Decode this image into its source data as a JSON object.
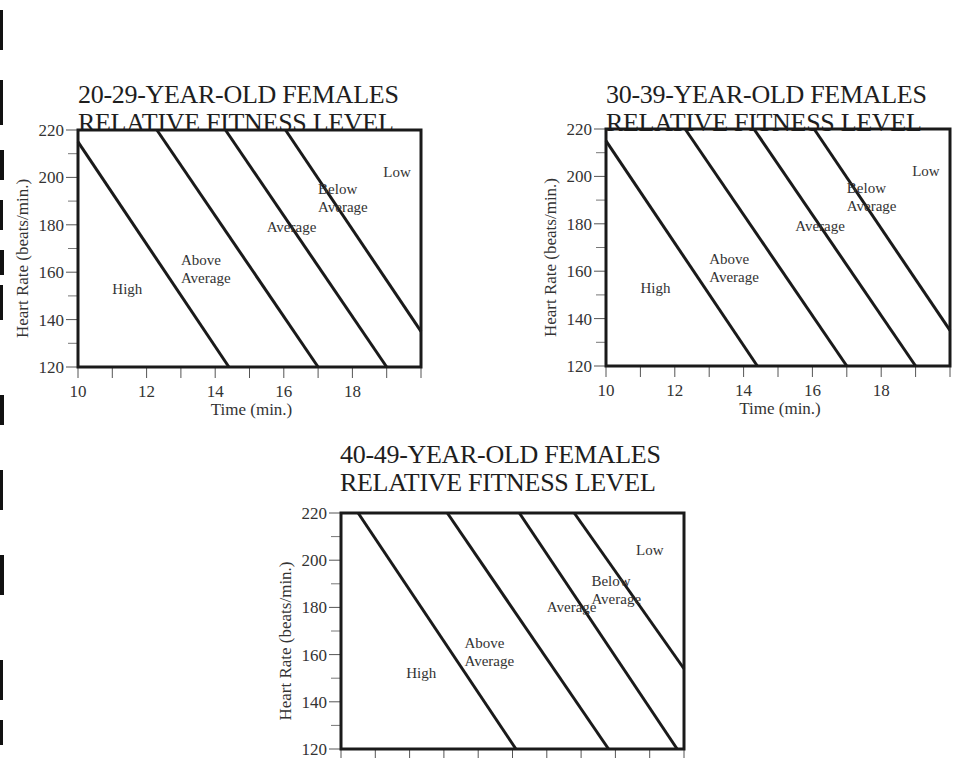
{
  "page": {
    "background": "#ffffff",
    "line_color": "#1a1a1a"
  },
  "chart_data": [
    {
      "type": "line",
      "title": "20-29-YEAR-OLD FEMALES",
      "subtitle": "RELATIVE FITNESS LEVEL",
      "xlabel": "Time (min.)",
      "ylabel": "Heart Rate (beats/min.)",
      "xlim": [
        10,
        20
      ],
      "ylim": [
        120,
        220
      ],
      "x_ticks": [
        10,
        12,
        14,
        16,
        18
      ],
      "x_minor_ticks": [
        10,
        11,
        12,
        13,
        14,
        15,
        16,
        17,
        18,
        19,
        20
      ],
      "y_ticks": [
        120,
        140,
        160,
        180,
        200,
        220
      ],
      "y_minor_ticks": [
        130,
        150,
        170,
        190,
        210
      ],
      "grid": false,
      "series": [
        {
          "name": "High / Above Average boundary",
          "x": [
            10.0,
            14.4
          ],
          "y": [
            215,
            120
          ]
        },
        {
          "name": "Above Average / Average boundary",
          "x": [
            12.3,
            17.0
          ],
          "y": [
            220,
            120
          ]
        },
        {
          "name": "Average / Below Average boundary",
          "x": [
            14.3,
            19.0
          ],
          "y": [
            220,
            120
          ]
        },
        {
          "name": "Below Average / Low boundary",
          "x": [
            16.05,
            20.0
          ],
          "y": [
            220,
            135
          ]
        }
      ],
      "region_labels": [
        {
          "text": "High",
          "lines": [
            "High"
          ],
          "x": 11.0,
          "y": 151
        },
        {
          "text": "Above Average",
          "lines": [
            "Above",
            "Average"
          ],
          "x": 13.0,
          "y": 163
        },
        {
          "text": "Average",
          "lines": [
            "Average"
          ],
          "x": 15.5,
          "y": 177
        },
        {
          "text": "Below Average",
          "lines": [
            "Below",
            "Average"
          ],
          "x": 17.0,
          "y": 193
        },
        {
          "text": "Low",
          "lines": [
            "Low"
          ],
          "x": 18.9,
          "y": 200
        }
      ]
    },
    {
      "type": "line",
      "title": "30-39-YEAR-OLD FEMALES",
      "subtitle": "RELATIVE FITNESS LEVEL",
      "xlabel": "Time (min.)",
      "ylabel": "Heart Rate (beats/min.)",
      "xlim": [
        10,
        20
      ],
      "ylim": [
        120,
        220
      ],
      "x_ticks": [
        10,
        12,
        14,
        16,
        18
      ],
      "x_minor_ticks": [
        10,
        11,
        12,
        13,
        14,
        15,
        16,
        17,
        18,
        19,
        20
      ],
      "y_ticks": [
        120,
        140,
        160,
        180,
        200,
        220
      ],
      "y_minor_ticks": [
        130,
        150,
        170,
        190,
        210
      ],
      "grid": false,
      "series": [
        {
          "name": "High / Above Average boundary",
          "x": [
            10.0,
            14.4
          ],
          "y": [
            215,
            120
          ]
        },
        {
          "name": "Above Average / Average boundary",
          "x": [
            12.3,
            17.0
          ],
          "y": [
            220,
            120
          ]
        },
        {
          "name": "Average / Below Average boundary",
          "x": [
            14.3,
            19.0
          ],
          "y": [
            220,
            120
          ]
        },
        {
          "name": "Below Average / Low boundary",
          "x": [
            16.05,
            20.0
          ],
          "y": [
            220,
            135
          ]
        }
      ],
      "region_labels": [
        {
          "text": "High",
          "lines": [
            "High"
          ],
          "x": 11.0,
          "y": 151
        },
        {
          "text": "Above Average",
          "lines": [
            "Above",
            "Average"
          ],
          "x": 13.0,
          "y": 163
        },
        {
          "text": "Average",
          "lines": [
            "Average"
          ],
          "x": 15.5,
          "y": 177
        },
        {
          "text": "Below Average",
          "lines": [
            "Below",
            "Average"
          ],
          "x": 17.0,
          "y": 193
        },
        {
          "text": "Low",
          "lines": [
            "Low"
          ],
          "x": 18.9,
          "y": 200
        }
      ]
    },
    {
      "type": "line",
      "title": "40-49-YEAR-OLD FEMALES",
      "subtitle": "RELATIVE FITNESS LEVEL",
      "xlabel": "",
      "ylabel": "Heart Rate (beats/min.)",
      "xlim": [
        10,
        20
      ],
      "ylim": [
        120,
        220
      ],
      "x_ticks": [],
      "x_minor_ticks": [
        10,
        11,
        12,
        13,
        14,
        15,
        16,
        17,
        18,
        19,
        20
      ],
      "y_ticks": [
        120,
        140,
        160,
        180,
        200,
        220
      ],
      "y_minor_ticks": [
        130,
        150,
        170,
        190,
        210
      ],
      "grid": false,
      "series": [
        {
          "name": "High / Above Average boundary",
          "x": [
            10.5,
            15.1
          ],
          "y": [
            220,
            120
          ]
        },
        {
          "name": "Above Average / Average boundary",
          "x": [
            13.1,
            17.8
          ],
          "y": [
            220,
            120
          ]
        },
        {
          "name": "Average / Below Average boundary",
          "x": [
            15.2,
            19.8
          ],
          "y": [
            220,
            120
          ]
        },
        {
          "name": "Below Average / Low boundary",
          "x": [
            16.8,
            20.0
          ],
          "y": [
            220,
            154
          ]
        }
      ],
      "region_labels": [
        {
          "text": "High",
          "lines": [
            "High"
          ],
          "x": 11.9,
          "y": 150
        },
        {
          "text": "Above Average",
          "lines": [
            "Above",
            "Average"
          ],
          "x": 13.6,
          "y": 163
        },
        {
          "text": "Average",
          "lines": [
            "Average"
          ],
          "x": 16.0,
          "y": 178
        },
        {
          "text": "Below Average",
          "lines": [
            "Below",
            "Average"
          ],
          "x": 17.3,
          "y": 189
        },
        {
          "text": "Low",
          "lines": [
            "Low"
          ],
          "x": 18.6,
          "y": 202
        }
      ]
    }
  ]
}
